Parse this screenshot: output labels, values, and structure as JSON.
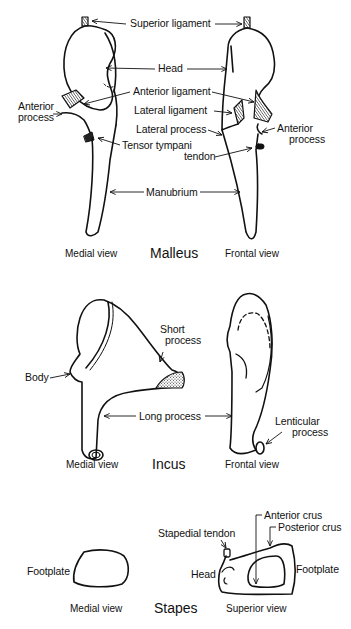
{
  "malleus": {
    "title": "Malleus",
    "medial_view": "Medial view",
    "frontal_view": "Frontal view",
    "labels": {
      "superior_ligament": "Superior ligament",
      "head": "Head",
      "anterior_ligament": "Anterior ligament",
      "lateral_ligament": "Lateral ligament",
      "lateral_process": "Lateral process",
      "anterior_process_left_1": "Anterior",
      "anterior_process_left_2": "process",
      "anterior_process_right_1": "Anterior",
      "anterior_process_right_2": "process",
      "tensor_tympani_1": "Tensor tympani",
      "tensor_tympani_2": "tendon",
      "manubrium": "Manubrium"
    }
  },
  "incus": {
    "title": "Incus",
    "medial_view": "Medial view",
    "frontal_view": "Frontal view",
    "labels": {
      "short_process_1": "Short",
      "short_process_2": "process",
      "body": "Body",
      "long_process": "Long process",
      "lenticular_process_1": "Lenticular",
      "lenticular_process_2": "process"
    }
  },
  "stapes": {
    "title": "Stapes",
    "medial_view": "Medial view",
    "superior_view": "Superior view",
    "labels": {
      "footplate_left": "Footplate",
      "stapedial_tendon": "Stapedial tendon",
      "anterior_crus": "Anterior crus",
      "posterior_crus": "Posterior crus",
      "head": "Head",
      "footplate_right": "Footplate"
    }
  }
}
